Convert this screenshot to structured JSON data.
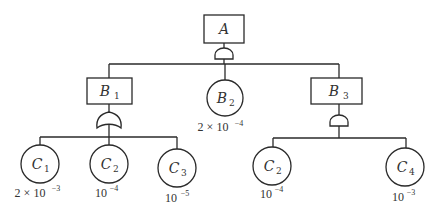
{
  "diagram": {
    "type": "fault-tree",
    "top_event": {
      "id": "A",
      "label": "A",
      "shape": "rectangle",
      "gate": "AND"
    },
    "intermediate_events": [
      {
        "id": "B1",
        "label": "B",
        "subscript": "1",
        "shape": "rectangle",
        "gate": "OR",
        "children": [
          "C1",
          "C2",
          "C3"
        ]
      },
      {
        "id": "B3",
        "label": "B",
        "subscript": "3",
        "shape": "rectangle",
        "gate": "AND",
        "children": [
          "C2",
          "C4"
        ]
      }
    ],
    "basic_events": [
      {
        "id": "B2",
        "label": "B",
        "subscript": "2",
        "prob_coef": "2 × 10",
        "prob_exp": "−4"
      },
      {
        "id": "C1",
        "label": "C",
        "subscript": "1",
        "prob_coef": "2 × 10",
        "prob_exp": "−3"
      },
      {
        "id": "C2_left",
        "label": "C",
        "subscript": "2",
        "prob_coef": "10",
        "prob_exp": "−4"
      },
      {
        "id": "C3",
        "label": "C",
        "subscript": "3",
        "prob_coef": "10",
        "prob_exp": "−5"
      },
      {
        "id": "C2_right",
        "label": "C",
        "subscript": "2",
        "prob_coef": "10",
        "prob_exp": "−4"
      },
      {
        "id": "C4",
        "label": "C",
        "subscript": "4",
        "prob_coef": "10",
        "prob_exp": "−3"
      }
    ],
    "top_event_children": [
      "B1",
      "B2",
      "B3"
    ]
  }
}
